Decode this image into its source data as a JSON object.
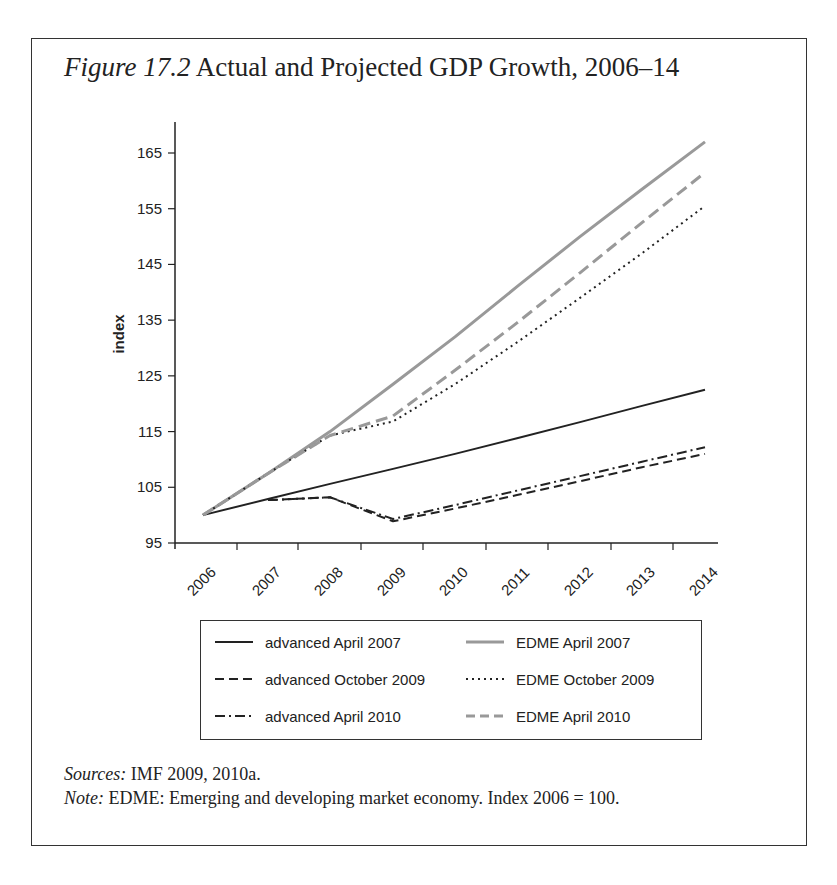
{
  "figure": {
    "label": "Figure 17.2",
    "title": "Actual and Projected GDP Growth, 2006–14",
    "sources_label": "Sources:",
    "sources_text": " IMF 2009, 2010a.",
    "note_label": "Note:",
    "note_text": " EDME: Emerging and developing market economy. Index 2006 = 100."
  },
  "chart_data": {
    "type": "line",
    "title": "Actual and Projected GDP Growth, 2006–14",
    "xlabel": "",
    "ylabel": "index",
    "ylim": [
      95,
      170
    ],
    "yticks": [
      95,
      105,
      115,
      125,
      135,
      145,
      155,
      165
    ],
    "x": [
      "2006",
      "2007",
      "2008",
      "2009",
      "2010",
      "2011",
      "2012",
      "2013",
      "2014"
    ],
    "grid": false,
    "legend_position": "below",
    "series": [
      {
        "name": "advanced April 2007",
        "style": "solid",
        "color": "#222222",
        "values": [
          100,
          102.9,
          105.6,
          108.3,
          111.0,
          113.8,
          116.7,
          119.6,
          122.5
        ]
      },
      {
        "name": "advanced October 2009",
        "style": "dashed",
        "color": "#222222",
        "values": [
          null,
          102.7,
          103.2,
          98.9,
          101.2,
          103.6,
          106.1,
          108.6,
          111.0
        ]
      },
      {
        "name": "advanced April 2010",
        "style": "dashdot",
        "color": "#222222",
        "values": [
          null,
          102.7,
          103.2,
          99.3,
          101.8,
          104.4,
          107.0,
          109.6,
          112.2
        ]
      },
      {
        "name": "EDME April 2007",
        "style": "solid",
        "color": "#999999",
        "values": [
          100,
          107.5,
          115.0,
          123.5,
          132.0,
          141.0,
          150.0,
          158.5,
          167.0
        ]
      },
      {
        "name": "EDME October 2009",
        "style": "dotted",
        "color": "#222222",
        "values": [
          100,
          107.5,
          114.3,
          116.8,
          123.5,
          131.0,
          139.0,
          147.0,
          155.5
        ]
      },
      {
        "name": "EDME April 2010",
        "style": "dashed",
        "color": "#999999",
        "values": [
          100,
          107.5,
          114.3,
          117.8,
          126.0,
          134.5,
          143.5,
          152.5,
          161.5
        ]
      }
    ]
  }
}
